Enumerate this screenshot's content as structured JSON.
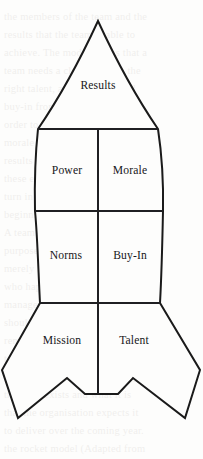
{
  "diagram": {
    "name": "rocket-model-diagram",
    "shape": "rocket",
    "colors": {
      "background": "#fdfdfc",
      "outline": "#1a1a1a",
      "divider": "#1f1f22",
      "label_text": "#17171a"
    },
    "stroke_width": 2.0,
    "segments": [
      {
        "id": "results",
        "label": "Results",
        "zone": "nose-cone",
        "cx": 98,
        "cy": 85
      },
      {
        "id": "power",
        "label": "Power",
        "zone": "upper-body-left",
        "cx": 67,
        "cy": 170
      },
      {
        "id": "morale",
        "label": "Morale",
        "zone": "upper-body-right",
        "cx": 130,
        "cy": 170
      },
      {
        "id": "norms",
        "label": "Norms",
        "zone": "lower-body-left",
        "cx": 66,
        "cy": 255
      },
      {
        "id": "buy_in",
        "label": "Buy-In",
        "zone": "lower-body-right",
        "cx": 130,
        "cy": 255
      },
      {
        "id": "mission",
        "label": "Mission",
        "zone": "fin-left",
        "cx": 62,
        "cy": 340
      },
      {
        "id": "talent",
        "label": "Talent",
        "zone": "fin-right",
        "cx": 134,
        "cy": 340
      }
    ],
    "dividers": [
      {
        "id": "divider-nose-base",
        "orientation": "horizontal",
        "y": 129,
        "x1": 38,
        "x2": 158
      },
      {
        "id": "divider-mid-body",
        "orientation": "horizontal",
        "y": 211,
        "x1": 35,
        "x2": 163
      },
      {
        "id": "divider-fin-shoulder",
        "orientation": "horizontal",
        "y": 303,
        "x1": 40,
        "x2": 160
      },
      {
        "id": "divider-centerline",
        "orientation": "vertical",
        "x": 98,
        "y1": 129,
        "y2": 394
      }
    ]
  },
  "background_bleed": {
    "note": "faint show-through text from reverse of page",
    "lines": [
      "the members of the team and the",
      "results that the team is able to",
      "achieve. The model shows that a",
      "team needs a clear mission, the",
      "right talent, agreed norms and",
      "buy-in from every member in",
      "order to build the power and",
      "morale needed to deliver the",
      "results expected of it. Each of",
      "these elements is considered in",
      "turn in the sections that follow,",
      "beginning with mission.",
      "A team without a shared sense of",
      "purpose is not really a team at all,",
      "merely a collection of individuals",
      "who happen to report to the same",
      "manager. The mission statement",
      "should be short enough to be",
      "remembered and specific enough",
      "to guide day-to-day decisions.",
      "It answers the question of why",
      "the team exists and what it is",
      "that the organisation expects it",
      "to deliver over the coming year.",
      "the rocket model (Adapted from"
    ]
  }
}
